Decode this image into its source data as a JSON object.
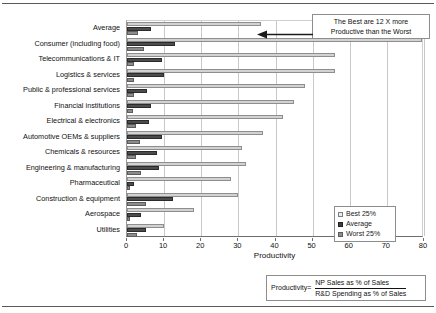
{
  "chart_data": {
    "type": "bar",
    "orientation": "horizontal",
    "title": "",
    "xlabel": "Productivity",
    "ylabel": "",
    "xlim": [
      0,
      80
    ],
    "xticks": [
      0,
      10,
      20,
      30,
      40,
      50,
      60,
      70,
      80
    ],
    "grid": true,
    "legend_position": "bottom-right",
    "categories": [
      "Average",
      "Consumer (including food)",
      "Telecommunications & IT",
      "Logistics & services",
      "Public & professional services",
      "Financial institutions",
      "Electrical & electronics",
      "Automotive OEMs & suppliers",
      "Chemicals & resources",
      "Engineering & manufacturing",
      "Pharmaceutical",
      "Construction & equipment",
      "Aerospace",
      "Utilities"
    ],
    "series": [
      {
        "name": "Best 25%",
        "color": "#d2d2d2",
        "values": [
          36,
          79.5,
          56,
          56,
          48,
          45,
          42,
          36.5,
          31,
          32,
          28,
          30,
          18,
          10
        ]
      },
      {
        "name": "Average",
        "color": "#4c4c4c",
        "values": [
          6.5,
          13,
          9.5,
          10,
          5.5,
          6.5,
          6,
          9.5,
          8,
          8.5,
          1.8,
          12.5,
          3.8,
          5
        ]
      },
      {
        "name": "Worst 25%",
        "color": "#8c8c8c",
        "values": [
          3,
          4.5,
          2,
          2,
          2,
          1.5,
          2.5,
          3.5,
          2.5,
          3.8,
          0.8,
          5,
          0.8,
          2.8
        ]
      }
    ],
    "annotations": [
      {
        "name": "best-vs-worst-callout",
        "line1": "The Best are 12 X more",
        "line2": "Productive than the Worst"
      }
    ]
  },
  "callout": {
    "line1": "The Best are 12 X more",
    "line2": "Productive than the Worst"
  },
  "legend": {
    "items": [
      {
        "label": "Best 25%",
        "swatch": "best"
      },
      {
        "label": "Average",
        "swatch": "average"
      },
      {
        "label": "Worst 25%",
        "swatch": "worst"
      }
    ]
  },
  "footnote": {
    "prefix": "Productivity=",
    "numerator": "NP Sales as % of Sales",
    "denominator": "R&D Spending as % of Sales"
  },
  "axis": {
    "x_title": "Productivity"
  }
}
